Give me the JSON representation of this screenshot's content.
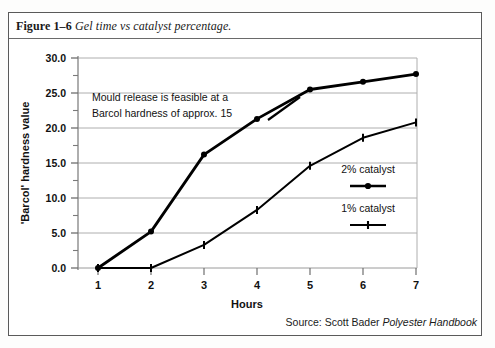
{
  "figure": {
    "label": "Figure 1–6",
    "title": "Gel time vs catalyst percentage.",
    "source_prefix": "Source: Scott Bader ",
    "source_italic": "Polyester Handbook"
  },
  "annotation": {
    "line1": "Mould release is feasible at a",
    "line2": "Barcol hardness of approx. 15"
  },
  "legend": {
    "item1": "2% catalyst",
    "item2": "1% catalyst"
  },
  "axis": {
    "y_ticks": [
      "0.0",
      "5.0",
      "10.0",
      "15.0",
      "20.0",
      "25.0",
      "30.0"
    ],
    "x_ticks": [
      "1",
      "2",
      "3",
      "4",
      "5",
      "6",
      "7"
    ],
    "ylabel": "'Barcol' hardness value",
    "xlabel": "Hours"
  },
  "colors": {
    "line": "#000000",
    "grid": "#aeaeae",
    "axis": "#8c8c8c",
    "frame": "#5a5a5a",
    "text": "#111111"
  },
  "chart_data": {
    "type": "line",
    "title": "Gel time vs catalyst percentage.",
    "xlabel": "Hours",
    "ylabel": "'Barcol' hardness value",
    "x": [
      1,
      2,
      3,
      4,
      5,
      6,
      7
    ],
    "xlim": [
      1,
      7
    ],
    "ylim": [
      0.0,
      30.0
    ],
    "y_ticks": [
      0.0,
      5.0,
      10.0,
      15.0,
      20.0,
      25.0,
      30.0
    ],
    "y_minor_tick_step": 2.5,
    "grid": "horizontal",
    "legend_position": "right-middle",
    "series": [
      {
        "name": "2% catalyst",
        "marker": "circle",
        "linewidth": "thick",
        "values": [
          0.0,
          5.2,
          16.2,
          21.3,
          25.5,
          26.6,
          27.7
        ]
      },
      {
        "name": "1% catalyst",
        "marker": "tick",
        "linewidth": "thin",
        "values": [
          0.0,
          0.0,
          3.3,
          8.3,
          14.6,
          18.6,
          20.8
        ]
      }
    ],
    "annotations": [
      {
        "text": "Mould release is feasible at a Barcol hardness of approx. 15",
        "target_value": 15
      }
    ],
    "source": "Source: Scott Bader Polyester Handbook"
  }
}
